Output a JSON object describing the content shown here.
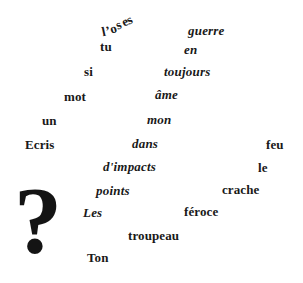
{
  "page": {
    "background_color": "#ffffff",
    "ink_color": "#191919",
    "width": 303,
    "height": 283
  },
  "poem": {
    "full_text_roman": "tu si mot un Ecris feu le crache féroce troupeau Ton",
    "full_text_italic": "guerre en toujours âme mon dans d'impacts points Les",
    "arc_word": "l'oses",
    "arc_letters": [
      "l",
      "'",
      "o",
      "s",
      "e",
      "s"
    ],
    "punctuation": "?"
  },
  "words": [
    {
      "text": "tu",
      "style": "roman",
      "x": 100,
      "y": 40,
      "size": 13
    },
    {
      "text": "guerre",
      "style": "italic",
      "x": 188,
      "y": 24,
      "size": 13
    },
    {
      "text": "en",
      "style": "italic",
      "x": 184,
      "y": 43,
      "size": 13
    },
    {
      "text": "si",
      "style": "roman",
      "x": 84,
      "y": 65,
      "size": 13
    },
    {
      "text": "toujours",
      "style": "italic",
      "x": 164,
      "y": 65,
      "size": 13
    },
    {
      "text": "mot",
      "style": "roman",
      "x": 64,
      "y": 90,
      "size": 13
    },
    {
      "text": "âme",
      "style": "italic",
      "x": 155,
      "y": 88,
      "size": 13
    },
    {
      "text": "un",
      "style": "roman",
      "x": 42,
      "y": 114,
      "size": 13
    },
    {
      "text": "mon",
      "style": "italic",
      "x": 147,
      "y": 113,
      "size": 13
    },
    {
      "text": "Ecris",
      "style": "roman",
      "x": 25,
      "y": 138,
      "size": 13
    },
    {
      "text": "dans",
      "style": "italic",
      "x": 132,
      "y": 137,
      "size": 13
    },
    {
      "text": "feu",
      "style": "roman",
      "x": 266,
      "y": 138,
      "size": 13
    },
    {
      "text": "d'impacts",
      "style": "italic",
      "x": 103,
      "y": 160,
      "size": 13
    },
    {
      "text": "le",
      "style": "roman",
      "x": 258,
      "y": 161,
      "size": 13
    },
    {
      "text": "points",
      "style": "italic",
      "x": 96,
      "y": 184,
      "size": 13
    },
    {
      "text": "crache",
      "style": "roman",
      "x": 222,
      "y": 183,
      "size": 13
    },
    {
      "text": "Les",
      "style": "italic",
      "x": 83,
      "y": 206,
      "size": 13
    },
    {
      "text": "féroce",
      "style": "roman",
      "x": 184,
      "y": 205,
      "size": 13
    },
    {
      "text": "troupeau",
      "style": "roman",
      "x": 128,
      "y": 229,
      "size": 13
    },
    {
      "text": "Ton",
      "style": "roman",
      "x": 87,
      "y": 251,
      "size": 13
    }
  ],
  "arc": {
    "x": 102,
    "y": 14,
    "size": 13,
    "letters": [
      {
        "ch": "l",
        "dx": 0,
        "dy": 10,
        "rot": -12
      },
      {
        "ch": "’",
        "dx": 0,
        "dy": 9,
        "rot": -14
      },
      {
        "ch": "o",
        "dx": 0,
        "dy": 7,
        "rot": -18
      },
      {
        "ch": "s",
        "dx": 0,
        "dy": 3,
        "rot": -22
      },
      {
        "ch": "e",
        "dx": 0,
        "dy": 0,
        "rot": -24
      },
      {
        "ch": "s",
        "dx": 0,
        "dy": -2,
        "rot": -26
      }
    ]
  },
  "question_mark": {
    "glyph": "?",
    "x": 14,
    "y": 173,
    "size": 96
  }
}
